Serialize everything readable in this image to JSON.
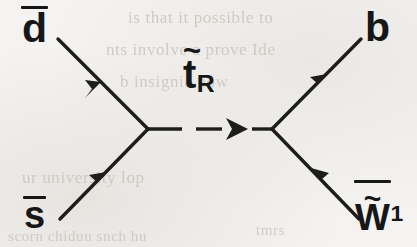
{
  "figure": {
    "kind": "feynman-diagram",
    "process": "dbar sbar -> stop_R -> b winobar_1",
    "ink_color": "#171717",
    "paper_color": "#f4f3f1"
  },
  "labels": {
    "incoming_top": {
      "symbol": "d",
      "accent": "bar",
      "text": "d"
    },
    "incoming_bottom": {
      "symbol": "s",
      "accent": "bar",
      "text": "s"
    },
    "propagator": {
      "symbol": "t",
      "accent": "tilde",
      "subscript": "R",
      "text": "t",
      "tilde_glyph": "~",
      "sub_text": "R"
    },
    "outgoing_top": {
      "symbol": "b",
      "accent": "none",
      "text": "b"
    },
    "outgoing_bottom": {
      "symbol": "W",
      "accent": "bar-tilde",
      "subscript": "1",
      "text": "W",
      "tilde_glyph": "~",
      "sub_text": "1"
    }
  },
  "ghost_text": {
    "line1": "is that it possible to",
    "line2": "nts involve a prove  Ide",
    "line3": "b  insignia  now",
    "line4": "ur  university lop",
    "line5": "scorn  chiduu  snch   hu",
    "line6": "tmrs"
  },
  "vertices": {
    "left": {
      "x": 148,
      "y": 129
    },
    "right": {
      "x": 272,
      "y": 129
    }
  },
  "lines": [
    {
      "name": "dbar-line",
      "from": [
        58,
        39
      ],
      "to": [
        148,
        129
      ],
      "style": "solid",
      "arrow": "toward-vertex"
    },
    {
      "name": "sbar-line",
      "from": [
        60,
        219
      ],
      "to": [
        148,
        129
      ],
      "style": "solid",
      "arrow": "toward-vertex"
    },
    {
      "name": "propagator-line",
      "from": [
        148,
        129
      ],
      "to": [
        272,
        129
      ],
      "style": "dashed",
      "arrow": "right"
    },
    {
      "name": "b-line",
      "from": [
        272,
        129
      ],
      "to": [
        361,
        39
      ],
      "style": "solid",
      "arrow": "outward"
    },
    {
      "name": "wino-line",
      "from": [
        272,
        129
      ],
      "to": [
        359,
        219
      ],
      "style": "solid",
      "arrow": "toward-vertex"
    }
  ]
}
